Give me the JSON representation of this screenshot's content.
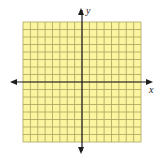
{
  "chart_data": {
    "type": "coordinate-grid",
    "title": "",
    "xlabel": "x",
    "ylabel": "y",
    "grid": true,
    "grid_cells_x": 16,
    "grid_cells_y": 16,
    "xlim": [
      -8,
      8
    ],
    "ylim": [
      -8,
      8
    ],
    "tick_labels": [],
    "series": [],
    "colors": {
      "fill": "#FBF5A0",
      "grid_line": "#A9A25E",
      "axis": "#1E1E1E",
      "label": "#222222"
    }
  },
  "labels": {
    "x_axis": "x",
    "y_axis": "y"
  }
}
